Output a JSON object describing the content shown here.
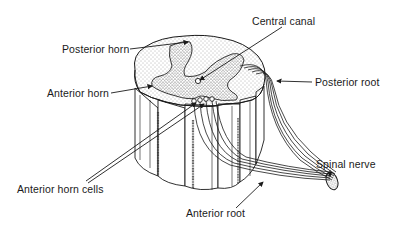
{
  "figure": {
    "colors": {
      "ink": "#1a1a1a",
      "background": "#ffffff",
      "stipple": "#555555"
    }
  },
  "labels": {
    "central_canal": "Central canal",
    "posterior_horn": "Posterior horn",
    "anterior_horn": "Anterior horn",
    "posterior_root": "Posterior root",
    "spinal_nerve": "Spinal nerve",
    "anterior_horn_cells": "Anterior horn cells",
    "anterior_root": "Anterior root"
  }
}
